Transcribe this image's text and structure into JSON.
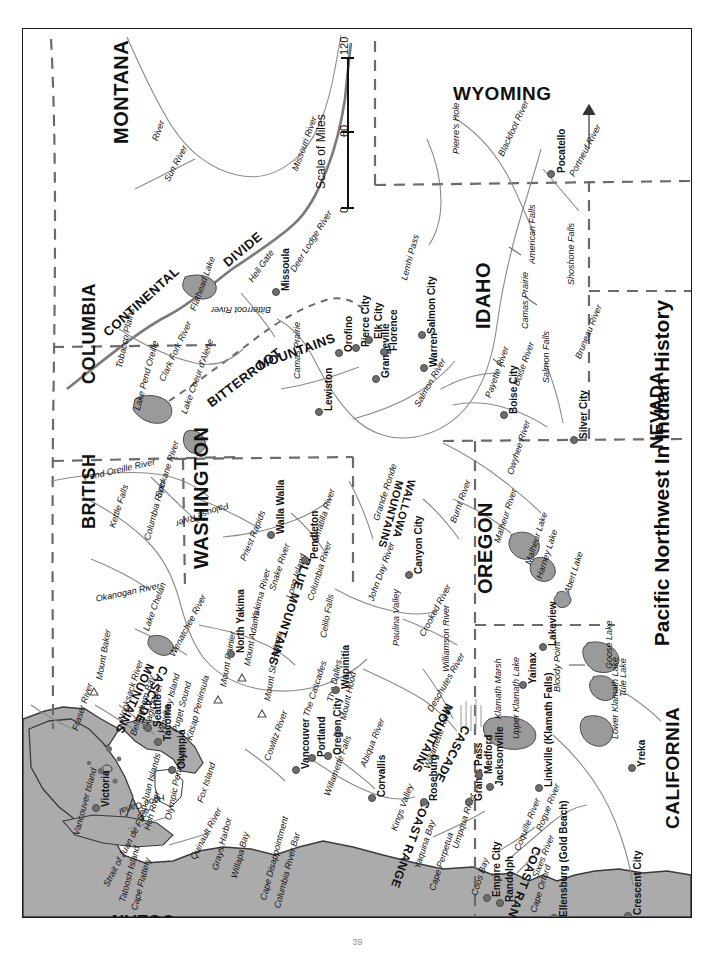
{
  "title": "Pacific Northwest In Indian History",
  "page_number": "39",
  "colors": {
    "ocean": "#ababab",
    "lake": "#9a9a9a",
    "border_dashed": "#6b6b6b",
    "river": "#8a8a8a",
    "ink": "#111111"
  },
  "scale": {
    "label": "Scale of Miles",
    "ticks": [
      "0",
      "60",
      "120"
    ]
  },
  "states": [
    {
      "name": "MONTANA",
      "x": 88,
      "y": 115,
      "rot": -90,
      "size": 20
    },
    {
      "name": "WYOMING",
      "x": 430,
      "y": 55,
      "rot": 0,
      "size": 19
    },
    {
      "name": "UTAH",
      "x": 673,
      "y": 232,
      "rot": -90,
      "size": 18
    },
    {
      "name": "IDAHO",
      "x": 450,
      "y": 300,
      "rot": -90,
      "size": 20
    },
    {
      "name": "NEVADA",
      "x": 625,
      "y": 420,
      "rot": -90,
      "size": 18
    },
    {
      "name": "BRITISH",
      "x": 57,
      "y": 500,
      "rot": -90,
      "size": 18
    },
    {
      "name": "COLUMBIA",
      "x": 57,
      "y": 355,
      "rot": -90,
      "size": 18
    },
    {
      "name": "WASHINGTON",
      "x": 168,
      "y": 540,
      "rot": -90,
      "size": 20
    },
    {
      "name": "OREGON",
      "x": 452,
      "y": 565,
      "rot": -90,
      "size": 20
    },
    {
      "name": "CALIFORNIA",
      "x": 640,
      "y": 800,
      "rot": -90,
      "size": 19
    }
  ],
  "oceans": [
    {
      "name": "PACIFIC",
      "x": 320,
      "y": 905,
      "rot": 180,
      "size": 17
    },
    {
      "name": "OCEAN",
      "x": 152,
      "y": 900,
      "rot": 180,
      "size": 17
    }
  ],
  "ranges": [
    {
      "name": "CONTINENTAL",
      "x": 78,
      "y": 300,
      "rot": -42,
      "size": 13
    },
    {
      "name": "DIVIDE",
      "x": 198,
      "y": 230,
      "rot": -40,
      "size": 13
    },
    {
      "name": "BITTERROOT",
      "x": 182,
      "y": 370,
      "rot": -37,
      "size": 13
    },
    {
      "name": "MOUNTAINS",
      "x": 233,
      "y": 330,
      "rot": -20,
      "size": 13
    },
    {
      "name": "WALLOWA",
      "x": 394,
      "y": 452,
      "rot": 105,
      "size": 11
    },
    {
      "name": "MOUNTAINS",
      "x": 382,
      "y": 453,
      "rot": 105,
      "size": 11
    },
    {
      "name": "BLUE MOUNTAINS",
      "x": 290,
      "y": 530,
      "rot": 108,
      "size": 12
    },
    {
      "name": "CASCADE",
      "x": 147,
      "y": 640,
      "rot": 115,
      "size": 12
    },
    {
      "name": "MOUNTAINS",
      "x": 133,
      "y": 638,
      "rot": 115,
      "size": 12
    },
    {
      "name": "CASCADE",
      "x": 449,
      "y": 700,
      "rot": 117,
      "size": 12
    },
    {
      "name": "MOUNTAINS",
      "x": 432,
      "y": 678,
      "rot": 117,
      "size": 12
    },
    {
      "name": "COAST RANGE",
      "x": 409,
      "y": 773,
      "rot": 110,
      "size": 12
    },
    {
      "name": "COAST RANGE",
      "x": 520,
      "y": 820,
      "rot": 110,
      "size": 12
    }
  ],
  "cities": [
    {
      "name": "Pocatello",
      "x": 527,
      "y": 144,
      "rot": -90,
      "dx": 7,
      "dy": 0
    },
    {
      "name": "Missoula",
      "x": 252,
      "y": 262,
      "rot": -90,
      "dx": 6,
      "dy": 0
    },
    {
      "name": "Orofino",
      "x": 315,
      "y": 323,
      "rot": -90,
      "dx": 6,
      "dy": 0
    },
    {
      "name": "Pierce City",
      "x": 332,
      "y": 318,
      "rot": -90,
      "dx": 6,
      "dy": 0
    },
    {
      "name": "Grangeville",
      "x": 352,
      "y": 349,
      "rot": -90,
      "dx": 6,
      "dy": 0
    },
    {
      "name": "Elk City",
      "x": 345,
      "y": 310,
      "rot": -90,
      "dx": 6,
      "dy": 0
    },
    {
      "name": "Florence",
      "x": 360,
      "y": 322,
      "rot": -90,
      "dx": 6,
      "dy": 0
    },
    {
      "name": "Warren",
      "x": 400,
      "y": 338,
      "rot": -90,
      "dx": 6,
      "dy": 0
    },
    {
      "name": "Salmon City",
      "x": 398,
      "y": 305,
      "rot": -90,
      "dx": 6,
      "dy": 0
    },
    {
      "name": "Lewiston",
      "x": 295,
      "y": 382,
      "rot": -90,
      "dx": 6,
      "dy": 0
    },
    {
      "name": "Boise City",
      "x": 480,
      "y": 385,
      "rot": -90,
      "dx": 6,
      "dy": 0
    },
    {
      "name": "Silver City",
      "x": 550,
      "y": 410,
      "rot": -90,
      "dx": 6,
      "dy": 0
    },
    {
      "name": "Walla Walla",
      "x": 247,
      "y": 505,
      "rot": -90,
      "dx": 6,
      "dy": 0
    },
    {
      "name": "Pendleton",
      "x": 281,
      "y": 530,
      "rot": -90,
      "dx": 6,
      "dy": 0
    },
    {
      "name": "Canyon City",
      "x": 385,
      "y": 545,
      "rot": -90,
      "dx": 6,
      "dy": 0
    },
    {
      "name": "Seattle",
      "x": 124,
      "y": 698,
      "rot": -90,
      "dx": 6,
      "dy": 0
    },
    {
      "name": "Tacoma",
      "x": 134,
      "y": 712,
      "rot": -90,
      "dx": 6,
      "dy": 0
    },
    {
      "name": "Olympia",
      "x": 148,
      "y": 740,
      "rot": -90,
      "dx": 6,
      "dy": 0
    },
    {
      "name": "Victoria",
      "x": 72,
      "y": 778,
      "rot": -90,
      "dx": 6,
      "dy": 0
    },
    {
      "name": "North Yakima",
      "x": 207,
      "y": 624,
      "rot": -90,
      "dx": 6,
      "dy": 0
    },
    {
      "name": "Wapinitia",
      "x": 312,
      "y": 660,
      "rot": -90,
      "dx": 6,
      "dy": 0
    },
    {
      "name": "Vancouver",
      "x": 272,
      "y": 740,
      "rot": -90,
      "dx": 6,
      "dy": 0
    },
    {
      "name": "Portland",
      "x": 288,
      "y": 728,
      "rot": -90,
      "dx": 6,
      "dy": 0
    },
    {
      "name": "Oregon City",
      "x": 304,
      "y": 726,
      "rot": -90,
      "dx": 6,
      "dy": 0
    },
    {
      "name": "Corvallis",
      "x": 348,
      "y": 768,
      "rot": -90,
      "dx": 6,
      "dy": 0
    },
    {
      "name": "Roseburg",
      "x": 400,
      "y": 772,
      "rot": -90,
      "dx": 6,
      "dy": 0
    },
    {
      "name": "Grants Pass",
      "x": 445,
      "y": 772,
      "rot": -90,
      "dx": 6,
      "dy": 0
    },
    {
      "name": "Medford",
      "x": 455,
      "y": 745,
      "rot": -90,
      "dx": 6,
      "dy": 0
    },
    {
      "name": "Jacksonville",
      "x": 466,
      "y": 757,
      "rot": -90,
      "dx": 6,
      "dy": 0
    },
    {
      "name": "Linkville (Klamath Falls)",
      "x": 515,
      "y": 758,
      "rot": -90,
      "dx": 6,
      "dy": 0
    },
    {
      "name": "Yainax",
      "x": 499,
      "y": 655,
      "rot": -90,
      "dx": 6,
      "dy": 0
    },
    {
      "name": "Lakeview",
      "x": 519,
      "y": 617,
      "rot": -90,
      "dx": 6,
      "dy": 0
    },
    {
      "name": "Yreka",
      "x": 608,
      "y": 738,
      "rot": -90,
      "dx": 6,
      "dy": 0
    },
    {
      "name": "Empire City",
      "x": 463,
      "y": 868,
      "rot": -90,
      "dx": 6,
      "dy": 0
    },
    {
      "name": "Randolph",
      "x": 476,
      "y": 873,
      "rot": -90,
      "dx": 6,
      "dy": 0
    },
    {
      "name": "Ellensburg (Gold Beach)",
      "x": 530,
      "y": 888,
      "rot": -90,
      "dx": 6,
      "dy": 0
    },
    {
      "name": "Crescent City",
      "x": 604,
      "y": 886,
      "rot": -90,
      "dx": 6,
      "dy": 0
    }
  ],
  "features": [
    {
      "name": "Pierre's Hole",
      "x": 429,
      "y": 125,
      "rot": -90,
      "size": 9
    },
    {
      "name": "Blackfoot River",
      "x": 474,
      "y": 125,
      "rot": -65,
      "size": 9
    },
    {
      "name": "Portneuf River",
      "x": 545,
      "y": 145,
      "rot": -62,
      "size": 9
    },
    {
      "name": "American Falls",
      "x": 505,
      "y": 235,
      "rot": -90,
      "size": 9
    },
    {
      "name": "Shoshone Falls",
      "x": 544,
      "y": 256,
      "rot": -90,
      "size": 9
    },
    {
      "name": "Camas Prairie",
      "x": 498,
      "y": 300,
      "rot": -90,
      "size": 9
    },
    {
      "name": "Salmon Falls",
      "x": 519,
      "y": 354,
      "rot": -90,
      "size": 9
    },
    {
      "name": "Bruneau River",
      "x": 551,
      "y": 328,
      "rot": -68,
      "size": 9
    },
    {
      "name": "Boise River",
      "x": 489,
      "y": 355,
      "rot": -70,
      "size": 9
    },
    {
      "name": "Payette River",
      "x": 461,
      "y": 367,
      "rot": -70,
      "size": 9
    },
    {
      "name": "Owyhee River",
      "x": 483,
      "y": 444,
      "rot": -72,
      "size": 9
    },
    {
      "name": "Malheur River",
      "x": 470,
      "y": 512,
      "rot": -72,
      "size": 9
    },
    {
      "name": "Malheur Lake",
      "x": 501,
      "y": 534,
      "rot": -72,
      "size": 9
    },
    {
      "name": "Harney Lake",
      "x": 512,
      "y": 548,
      "rot": -72,
      "size": 9
    },
    {
      "name": "Abert Lake",
      "x": 540,
      "y": 563,
      "rot": -72,
      "size": 9
    },
    {
      "name": "Goose Lake",
      "x": 582,
      "y": 640,
      "rot": -90,
      "size": 9
    },
    {
      "name": "Tule Lake",
      "x": 596,
      "y": 668,
      "rot": -90,
      "size": 9
    },
    {
      "name": "Lower Klamath Lake",
      "x": 588,
      "y": 710,
      "rot": -90,
      "size": 9
    },
    {
      "name": "Upper Klamath Lake",
      "x": 489,
      "y": 710,
      "rot": -90,
      "size": 9
    },
    {
      "name": "Klamath Marsh",
      "x": 471,
      "y": 690,
      "rot": -90,
      "size": 9
    },
    {
      "name": "Bloody Point",
      "x": 530,
      "y": 663,
      "rot": -90,
      "size": 9
    },
    {
      "name": "Williamson River",
      "x": 419,
      "y": 643,
      "rot": -90,
      "size": 9
    },
    {
      "name": "Deschutes River",
      "x": 403,
      "y": 680,
      "rot": -60,
      "size": 9
    },
    {
      "name": "Crooked River",
      "x": 395,
      "y": 605,
      "rot": -62,
      "size": 9
    },
    {
      "name": "Paulina Valley",
      "x": 369,
      "y": 617,
      "rot": -90,
      "size": 9
    },
    {
      "name": "John Day River",
      "x": 344,
      "y": 570,
      "rot": -70,
      "size": 9
    },
    {
      "name": "Burnt River",
      "x": 426,
      "y": 492,
      "rot": -70,
      "size": 9
    },
    {
      "name": "Grande Ronde",
      "x": 349,
      "y": 490,
      "rot": -72,
      "size": 9
    },
    {
      "name": "Lemhi Pass",
      "x": 377,
      "y": 250,
      "rot": -75,
      "size": 9
    },
    {
      "name": "Hell Gate",
      "x": 224,
      "y": 250,
      "rot": -55,
      "size": 9
    },
    {
      "name": "Deer Lodge River",
      "x": 266,
      "y": 240,
      "rot": -58,
      "size": 9
    },
    {
      "name": "Bitterroot River",
      "x": 248,
      "y": 285,
      "rot": 180,
      "size": 9
    },
    {
      "name": "Camas Prairie",
      "x": 270,
      "y": 350,
      "rot": -90,
      "size": 9
    },
    {
      "name": "Salmon River",
      "x": 390,
      "y": 375,
      "rot": -60,
      "size": 9
    },
    {
      "name": "Flathead Lake",
      "x": 166,
      "y": 280,
      "rot": -70,
      "size": 9
    },
    {
      "name": "Clark Fork River",
      "x": 135,
      "y": 350,
      "rot": -65,
      "size": 9
    },
    {
      "name": "Lake Coeur d'Alene",
      "x": 157,
      "y": 383,
      "rot": -70,
      "size": 9
    },
    {
      "name": "Lake Pend Oreille",
      "x": 110,
      "y": 380,
      "rot": -75,
      "size": 9
    },
    {
      "name": "Tobacco Plains",
      "x": 92,
      "y": 338,
      "rot": -78,
      "size": 9
    },
    {
      "name": "Pend Oreille River",
      "x": 60,
      "y": 445,
      "rot": -13,
      "size": 9
    },
    {
      "name": "Spokane River",
      "x": 131,
      "y": 467,
      "rot": -72,
      "size": 9
    },
    {
      "name": "Kettle Falls",
      "x": 85,
      "y": 497,
      "rot": -72,
      "size": 9
    },
    {
      "name": "Columbia River",
      "x": 120,
      "y": 510,
      "rot": -75,
      "size": 9
    },
    {
      "name": "Okanogan River",
      "x": 72,
      "y": 566,
      "rot": -12,
      "size": 9
    },
    {
      "name": "Lake Chelan",
      "x": 119,
      "y": 600,
      "rot": -70,
      "size": 9
    },
    {
      "name": "Wenatchee River",
      "x": 145,
      "y": 625,
      "rot": -62,
      "size": 9
    },
    {
      "name": "Palouse River",
      "x": 207,
      "y": 480,
      "rot": 160,
      "size": 9
    },
    {
      "name": "Priest Rapids",
      "x": 216,
      "y": 530,
      "rot": -68,
      "size": 9
    },
    {
      "name": "Snake River",
      "x": 245,
      "y": 560,
      "rot": -72,
      "size": 9
    },
    {
      "name": "Yakima River",
      "x": 227,
      "y": 590,
      "rot": -75,
      "size": 9
    },
    {
      "name": "Long Island",
      "x": 262,
      "y": 568,
      "rot": -72,
      "size": 9
    },
    {
      "name": "Umatilla River",
      "x": 288,
      "y": 512,
      "rot": -72,
      "size": 9
    },
    {
      "name": "Columbia River",
      "x": 283,
      "y": 570,
      "rot": -72,
      "size": 9
    },
    {
      "name": "Celilo Falls",
      "x": 296,
      "y": 608,
      "rot": -80,
      "size": 9
    },
    {
      "name": "The Cascades",
      "x": 279,
      "y": 686,
      "rot": -72,
      "size": 9
    },
    {
      "name": "The Dalles",
      "x": 303,
      "y": 672,
      "rot": -78,
      "size": 9
    },
    {
      "name": "Mount Hood",
      "x": 316,
      "y": 690,
      "rot": -78,
      "size": 9
    },
    {
      "name": "Mount Adams",
      "x": 220,
      "y": 636,
      "rot": -80,
      "size": 9
    },
    {
      "name": "Mount St. Helens",
      "x": 240,
      "y": 671,
      "rot": -80,
      "size": 9
    },
    {
      "name": "Mount Rainier",
      "x": 196,
      "y": 657,
      "rot": -80,
      "size": 9
    },
    {
      "name": "Mount Baker",
      "x": 72,
      "y": 650,
      "rot": -80,
      "size": 9
    },
    {
      "name": "Cowlitz River",
      "x": 240,
      "y": 730,
      "rot": -70,
      "size": 9
    },
    {
      "name": "Willamette Falls",
      "x": 300,
      "y": 765,
      "rot": -70,
      "size": 9
    },
    {
      "name": "Willamette River",
      "x": 400,
      "y": 738,
      "rot": -70,
      "size": 9
    },
    {
      "name": "Abiqua River",
      "x": 336,
      "y": 736,
      "rot": -68,
      "size": 9
    },
    {
      "name": "Kings Valley",
      "x": 367,
      "y": 800,
      "rot": -70,
      "size": 9
    },
    {
      "name": "Yaquina Bay",
      "x": 390,
      "y": 838,
      "rot": -72,
      "size": 9
    },
    {
      "name": "Cape Perpetua",
      "x": 405,
      "y": 860,
      "rot": -72,
      "size": 9
    },
    {
      "name": "Umpqua River",
      "x": 428,
      "y": 818,
      "rot": -72,
      "size": 9
    },
    {
      "name": "Coos Bay",
      "x": 447,
      "y": 865,
      "rot": -72,
      "size": 9
    },
    {
      "name": "Coquille River",
      "x": 490,
      "y": 820,
      "rot": -68,
      "size": 9
    },
    {
      "name": "Sixes River",
      "x": 508,
      "y": 847,
      "rot": -68,
      "size": 9
    },
    {
      "name": "Cape Orford",
      "x": 506,
      "y": 882,
      "rot": -72,
      "size": 9
    },
    {
      "name": "Rogue River",
      "x": 512,
      "y": 800,
      "rot": -68,
      "size": 9
    },
    {
      "name": "Fraser River",
      "x": 48,
      "y": 700,
      "rot": -72,
      "size": 9
    },
    {
      "name": "Nooksack River",
      "x": 94,
      "y": 690,
      "rot": -72,
      "size": 9
    },
    {
      "name": "Bellingham Bay",
      "x": 106,
      "y": 705,
      "rot": -72,
      "size": 9
    },
    {
      "name": "Skagit River",
      "x": 118,
      "y": 700,
      "rot": -72,
      "size": 9
    },
    {
      "name": "Whidbey Island",
      "x": 134,
      "y": 703,
      "rot": -75,
      "size": 9
    },
    {
      "name": "Puget Sound",
      "x": 148,
      "y": 702,
      "rot": -75,
      "size": 9
    },
    {
      "name": "Kitsap Peninsula",
      "x": 162,
      "y": 710,
      "rot": -75,
      "size": 9
    },
    {
      "name": "Hood Canal",
      "x": 143,
      "y": 772,
      "rot": 162,
      "size": 9
    },
    {
      "name": "Fox Island",
      "x": 173,
      "y": 772,
      "rot": -72,
      "size": 9
    },
    {
      "name": "San Juan Islands",
      "x": 113,
      "y": 790,
      "rot": -75,
      "size": 9
    },
    {
      "name": "Vancouver Island",
      "x": 49,
      "y": 805,
      "rot": -75,
      "size": 9
    },
    {
      "name": "Strait of Juan de Fuca",
      "x": 79,
      "y": 855,
      "rot": -62,
      "size": 9
    },
    {
      "name": "Tatoosh Island",
      "x": 95,
      "y": 872,
      "rot": -75,
      "size": 9
    },
    {
      "name": "Cape Flattery",
      "x": 107,
      "y": 880,
      "rot": -75,
      "size": 9
    },
    {
      "name": "Hoh River",
      "x": 120,
      "y": 800,
      "rot": -75,
      "size": 9
    },
    {
      "name": "Olympic Peninsula",
      "x": 141,
      "y": 790,
      "rot": -78,
      "size": 9
    },
    {
      "name": "Quinault River",
      "x": 166,
      "y": 828,
      "rot": -62,
      "size": 9
    },
    {
      "name": "Grays Harbor",
      "x": 188,
      "y": 840,
      "rot": -75,
      "size": 9
    },
    {
      "name": "Willapa Bay",
      "x": 207,
      "y": 848,
      "rot": -75,
      "size": 9
    },
    {
      "name": "Cape Disappointment",
      "x": 236,
      "y": 870,
      "rot": -75,
      "size": 9
    },
    {
      "name": "Columbia River Bar",
      "x": 250,
      "y": 878,
      "rot": -75,
      "size": 9
    },
    {
      "name": "Sun River",
      "x": 140,
      "y": 150,
      "rot": -62,
      "size": 9
    },
    {
      "name": "Missouri River",
      "x": 268,
      "y": 140,
      "rot": -70,
      "size": 9
    },
    {
      "name": "River",
      "x": 128,
      "y": 110,
      "rot": -70,
      "size": 9
    }
  ]
}
